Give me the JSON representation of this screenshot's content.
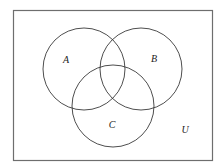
{
  "diagram": {
    "type": "venn",
    "universe": {
      "label": "U",
      "rect": {
        "x": 13,
        "y": 10,
        "width": 199,
        "height": 150
      }
    },
    "sets": [
      {
        "label": "A",
        "cx": 84,
        "cy": 69,
        "r": 41,
        "label_x": 66,
        "label_y": 63
      },
      {
        "label": "B",
        "cx": 141,
        "cy": 69,
        "r": 41,
        "label_x": 154,
        "label_y": 62
      },
      {
        "label": "C",
        "cx": 113,
        "cy": 106,
        "r": 41,
        "label_x": 112,
        "label_y": 128
      }
    ],
    "universe_label_pos": {
      "x": 185,
      "y": 133
    },
    "stroke_color": "#3a3a3a",
    "border_color": "#6e6e6e"
  }
}
